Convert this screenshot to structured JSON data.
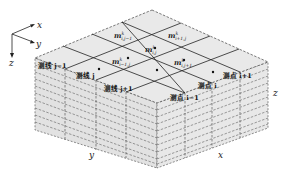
{
  "figure": {
    "axes_legend": {
      "x": "x",
      "y": "y",
      "z": "z"
    },
    "edge_labels": {
      "left_face_y": "y",
      "right_face_x": "x",
      "right_side_z": "z"
    },
    "grid_cells": [
      {
        "label": "m",
        "sup": "k",
        "sub": "i,j−1"
      },
      {
        "label": "m",
        "sup": "k",
        "sub": "i+1,j"
      },
      {
        "label": "m",
        "sup": "k",
        "sub": "i,j"
      },
      {
        "label": "m",
        "sup": "k",
        "sub": "i−1,j"
      },
      {
        "label": "m",
        "sup": "k",
        "sub": "i,j+1"
      }
    ],
    "survey_lines_y_face": [
      {
        "label": "测线 j−1"
      },
      {
        "label": "测线 j"
      },
      {
        "label": "测线 j+1"
      }
    ],
    "survey_lines_x_face": [
      {
        "label": "测点 i+1"
      },
      {
        "label": "测点 i"
      },
      {
        "label": "测点 i−1"
      }
    ],
    "colors": {
      "face_fill": "#e6e6e6",
      "side_fill": "#dedede",
      "solid_line": "#222222",
      "dashed_line": "#444444"
    }
  }
}
